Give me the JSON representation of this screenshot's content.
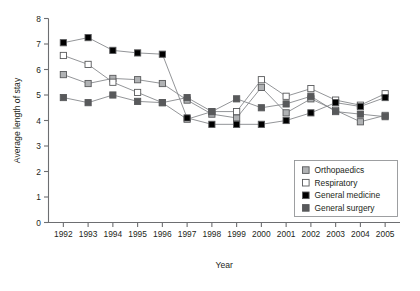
{
  "chart_data": {
    "type": "line",
    "title": "",
    "xlabel": "Year",
    "ylabel": "Average length of stay",
    "categories": [
      1992,
      1993,
      1994,
      1995,
      1996,
      1997,
      1998,
      1999,
      2000,
      2001,
      2002,
      2003,
      2004,
      2005
    ],
    "x": [
      "1992",
      "1993",
      "1994",
      "1995",
      "1996",
      "1997",
      "1998",
      "1999",
      "2000",
      "2001",
      "2002",
      "2003",
      "2004",
      "2005"
    ],
    "xlim": [
      1991.4,
      2005.6
    ],
    "ylim": [
      0,
      8
    ],
    "yticks": [
      0,
      1,
      2,
      3,
      4,
      5,
      6,
      7,
      8
    ],
    "xticks": [
      "1992",
      "1993",
      "1994",
      "1995",
      "1996",
      "1997",
      "1998",
      "1999",
      "2000",
      "2001",
      "2002",
      "2003",
      "2004",
      "2005"
    ],
    "grid": false,
    "legend_position": "lower-right",
    "series": [
      {
        "name": "Orthopaedics",
        "marker": "square",
        "color": "#b0b2b4",
        "values": [
          5.8,
          5.45,
          5.65,
          5.6,
          5.45,
          4.8,
          4.25,
          4.1,
          5.3,
          4.3,
          4.85,
          4.4,
          3.95,
          4.2
        ]
      },
      {
        "name": "Respiratory",
        "marker": "square",
        "color": "#ffffff",
        "values": [
          6.55,
          6.2,
          5.5,
          5.1,
          4.7,
          4.05,
          4.35,
          4.35,
          5.6,
          4.95,
          5.25,
          4.8,
          4.6,
          5.05
        ]
      },
      {
        "name": "General medicine",
        "marker": "square",
        "color": "#000000",
        "values": [
          7.05,
          7.25,
          6.75,
          6.65,
          6.6,
          4.1,
          3.85,
          3.85,
          3.85,
          4.0,
          4.3,
          4.7,
          4.55,
          4.9
        ]
      },
      {
        "name": "General surgery",
        "marker": "square",
        "color": "#58595b",
        "values": [
          4.9,
          4.7,
          5.0,
          4.75,
          4.7,
          4.9,
          4.35,
          4.85,
          4.5,
          4.65,
          4.95,
          4.35,
          4.25,
          4.15
        ]
      }
    ]
  },
  "legend": {
    "items": [
      {
        "label": "Orthopaedics",
        "color": "#b0b2b4"
      },
      {
        "label": "Respiratory",
        "color": "#ffffff"
      },
      {
        "label": "General medicine",
        "color": "#000000"
      },
      {
        "label": "General surgery",
        "color": "#58595b"
      }
    ]
  },
  "axes": {
    "y_title": "Average length of stay",
    "x_title": "Year"
  }
}
